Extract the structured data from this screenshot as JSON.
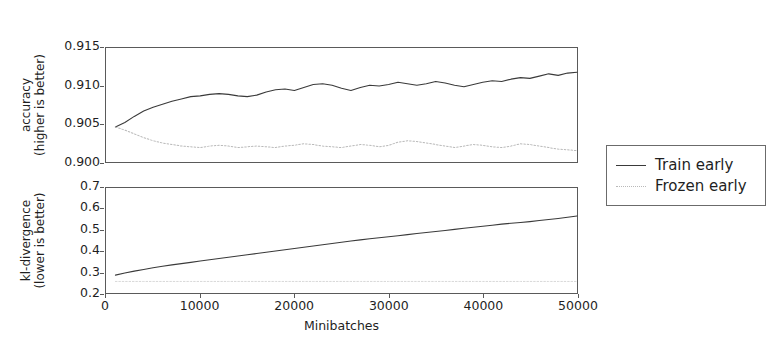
{
  "figure": {
    "background": "#ffffff",
    "series_colors": {
      "train_early": "#3a3a3a",
      "frozen_early": "#b9b9b9"
    }
  },
  "legend": {
    "position": "right",
    "entries": [
      {
        "label": "Train early",
        "style": "solid",
        "color": "#3a3a3a",
        "sample_name": "train-early-line-sample"
      },
      {
        "label": "Frozen early",
        "style": "dotted",
        "color": "#b9b9b9",
        "sample_name": "frozen-early-line-sample"
      }
    ]
  },
  "axes": {
    "accuracy": {
      "ylabel_line1": "accuracy",
      "ylabel_line2": "(higher is better)",
      "yticks": [
        "0.900",
        "0.905",
        "0.910",
        "0.915"
      ],
      "ylim": [
        0.9,
        0.915
      ],
      "xlim": [
        0,
        50000
      ]
    },
    "kl": {
      "ylabel_line1": "kl-divergence",
      "ylabel_line2": "(lower is better)",
      "yticks": [
        "0.2",
        "0.3",
        "0.4",
        "0.5",
        "0.6",
        "0.7"
      ],
      "ylim": [
        0.2,
        0.7
      ],
      "xlim": [
        0,
        50000
      ],
      "xlabel": "Minibatches",
      "xticks": [
        "0",
        "10000",
        "20000",
        "30000",
        "40000",
        "50000"
      ],
      "xtick_values": [
        0,
        10000,
        20000,
        30000,
        40000,
        50000
      ]
    }
  },
  "chart_data": [
    {
      "type": "line",
      "title": "",
      "xlabel": "",
      "ylabel": "accuracy (higher is better)",
      "xlim": [
        0,
        50000
      ],
      "ylim": [
        0.9,
        0.915
      ],
      "grid": false,
      "legend_position": "right",
      "x": [
        1000,
        2000,
        3000,
        4000,
        5000,
        6000,
        7000,
        8000,
        9000,
        10000,
        11000,
        12000,
        13000,
        14000,
        15000,
        16000,
        17000,
        18000,
        19000,
        20000,
        21000,
        22000,
        23000,
        24000,
        25000,
        26000,
        27000,
        28000,
        29000,
        30000,
        31000,
        32000,
        33000,
        34000,
        35000,
        36000,
        37000,
        38000,
        39000,
        40000,
        41000,
        42000,
        43000,
        44000,
        45000,
        46000,
        47000,
        48000,
        49000,
        50000
      ],
      "series": [
        {
          "name": "Train early",
          "style": "solid",
          "color": "#3a3a3a",
          "values": [
            0.9046,
            0.9052,
            0.906,
            0.9067,
            0.9072,
            0.9076,
            0.908,
            0.9083,
            0.9086,
            0.9087,
            0.9089,
            0.909,
            0.9089,
            0.9087,
            0.9086,
            0.9088,
            0.9092,
            0.9095,
            0.9096,
            0.9094,
            0.9098,
            0.9102,
            0.9103,
            0.9101,
            0.9097,
            0.9094,
            0.9098,
            0.9101,
            0.91,
            0.9102,
            0.9105,
            0.9103,
            0.9101,
            0.9103,
            0.9106,
            0.9104,
            0.9101,
            0.9099,
            0.9102,
            0.9105,
            0.9107,
            0.9106,
            0.9109,
            0.9111,
            0.911,
            0.9113,
            0.9116,
            0.9114,
            0.9117,
            0.9118
          ]
        },
        {
          "name": "Frozen early",
          "style": "dotted",
          "color": "#b9b9b9",
          "values": [
            0.9046,
            0.9042,
            0.9037,
            0.9032,
            0.9028,
            0.9025,
            0.9023,
            0.9021,
            0.902,
            0.9019,
            0.9021,
            0.9022,
            0.9021,
            0.9019,
            0.902,
            0.9021,
            0.902,
            0.9019,
            0.9021,
            0.9022,
            0.9024,
            0.9023,
            0.9021,
            0.902,
            0.9019,
            0.9021,
            0.9023,
            0.9022,
            0.902,
            0.9022,
            0.9026,
            0.9028,
            0.9027,
            0.9025,
            0.9023,
            0.9021,
            0.9019,
            0.9021,
            0.9023,
            0.9022,
            0.902,
            0.9019,
            0.9021,
            0.9024,
            0.9023,
            0.9021,
            0.9019,
            0.9017,
            0.9016,
            0.9015
          ]
        }
      ]
    },
    {
      "type": "line",
      "title": "",
      "xlabel": "Minibatches",
      "ylabel": "kl-divergence (lower is better)",
      "xlim": [
        0,
        50000
      ],
      "ylim": [
        0.2,
        0.7
      ],
      "grid": false,
      "legend_position": "right",
      "x": [
        1000,
        2000,
        3000,
        4000,
        5000,
        6000,
        7000,
        8000,
        9000,
        10000,
        11000,
        12000,
        13000,
        14000,
        15000,
        16000,
        17000,
        18000,
        19000,
        20000,
        21000,
        22000,
        23000,
        24000,
        25000,
        26000,
        27000,
        28000,
        29000,
        30000,
        31000,
        32000,
        33000,
        34000,
        35000,
        36000,
        37000,
        38000,
        39000,
        40000,
        41000,
        42000,
        43000,
        44000,
        45000,
        46000,
        47000,
        48000,
        49000,
        50000
      ],
      "series": [
        {
          "name": "Train early",
          "style": "solid",
          "color": "#3a3a3a",
          "values": [
            0.285,
            0.295,
            0.304,
            0.312,
            0.32,
            0.327,
            0.334,
            0.34,
            0.346,
            0.352,
            0.358,
            0.364,
            0.37,
            0.376,
            0.382,
            0.388,
            0.394,
            0.4,
            0.406,
            0.412,
            0.418,
            0.424,
            0.43,
            0.436,
            0.442,
            0.448,
            0.453,
            0.458,
            0.463,
            0.468,
            0.473,
            0.478,
            0.483,
            0.488,
            0.493,
            0.498,
            0.503,
            0.508,
            0.513,
            0.518,
            0.523,
            0.528,
            0.532,
            0.536,
            0.54,
            0.545,
            0.55,
            0.555,
            0.561,
            0.567
          ]
        },
        {
          "name": "Frozen early",
          "style": "dotted",
          "color": "#d8d8d8",
          "values": [
            0.255,
            0.255,
            0.255,
            0.255,
            0.255,
            0.255,
            0.255,
            0.255,
            0.255,
            0.255,
            0.255,
            0.255,
            0.255,
            0.255,
            0.255,
            0.255,
            0.255,
            0.255,
            0.255,
            0.255,
            0.255,
            0.255,
            0.255,
            0.255,
            0.255,
            0.255,
            0.255,
            0.255,
            0.255,
            0.255,
            0.255,
            0.255,
            0.255,
            0.255,
            0.255,
            0.255,
            0.255,
            0.255,
            0.255,
            0.255,
            0.255,
            0.255,
            0.255,
            0.255,
            0.255,
            0.255,
            0.255,
            0.255,
            0.255,
            0.255
          ]
        }
      ]
    }
  ]
}
